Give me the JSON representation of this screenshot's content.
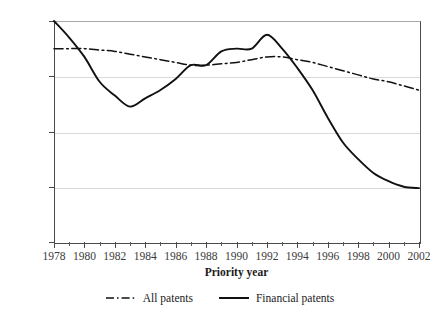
{
  "chart_data": {
    "type": "line",
    "title": "",
    "xlabel": "Priority year",
    "ylabel": "",
    "xlim": [
      1978,
      2002
    ],
    "ylim": [
      0,
      80
    ],
    "grid": true,
    "legend_position": "bottom",
    "x": [
      1978,
      1979,
      1980,
      1981,
      1982,
      1983,
      1984,
      1985,
      1986,
      1987,
      1988,
      1989,
      1990,
      1991,
      1992,
      1993,
      1994,
      1995,
      1996,
      1997,
      1998,
      1999,
      2000,
      2001,
      2002
    ],
    "xticks": [
      1978,
      1980,
      1982,
      1984,
      1986,
      1988,
      1990,
      1992,
      1994,
      1996,
      1998,
      2000,
      2002
    ],
    "xtick_labels": [
      "1978",
      "1980",
      "1982",
      "1984",
      "1986",
      "1988",
      "1990",
      "1992",
      "1994",
      "1996",
      "1998",
      "2000",
      "2002"
    ],
    "xticks_minor": [
      1979,
      1981,
      1983,
      1985,
      1987,
      1989,
      1991,
      1993,
      1995,
      1997,
      1999,
      2001
    ],
    "yticks": [
      0,
      20,
      40,
      60,
      80
    ],
    "ytick_labels": [
      "0%",
      "20%",
      "40%",
      "60%",
      "80%"
    ],
    "series": [
      {
        "name": "All patents",
        "style": "dash-dot",
        "color": "#111111",
        "values": [
          70,
          70,
          70,
          69.5,
          69,
          68,
          67,
          66,
          65,
          64,
          64,
          64.5,
          65,
          66,
          67,
          67,
          66,
          65,
          63.5,
          62,
          60.5,
          59,
          58,
          56.5,
          55
        ]
      },
      {
        "name": "Financial patents",
        "style": "solid",
        "color": "#111111",
        "values": [
          80,
          74,
          67,
          58,
          53,
          49,
          52,
          55,
          59,
          64,
          64,
          69,
          70,
          70,
          75,
          70,
          63,
          55,
          45,
          36,
          30,
          25,
          22,
          20,
          19.5
        ]
      }
    ]
  },
  "axes": {
    "x_title": "Priority year"
  },
  "legend": {
    "items": [
      {
        "label": "All patents",
        "style": "dash-dot"
      },
      {
        "label": "Financial patents",
        "style": "solid"
      }
    ]
  }
}
